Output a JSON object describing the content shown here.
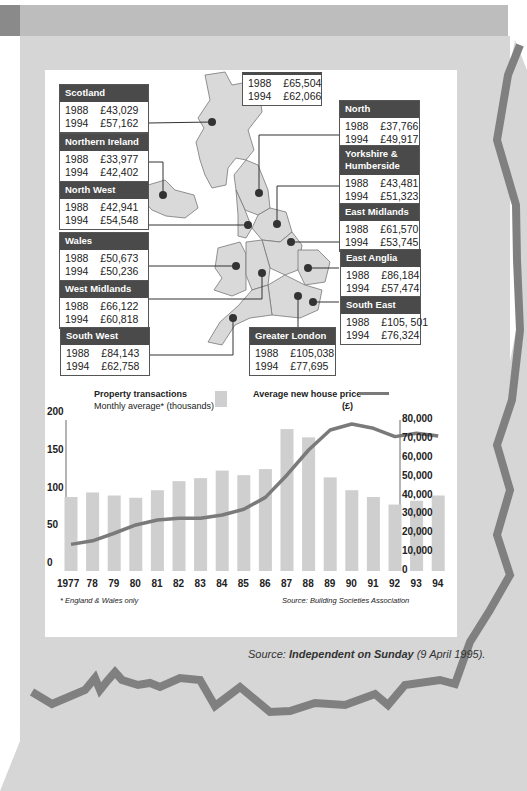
{
  "map": {
    "uk_box": {
      "rows": [
        {
          "year": "1988",
          "price": "£65,504"
        },
        {
          "year": "1994",
          "price": "£62,066"
        }
      ]
    },
    "regions": [
      {
        "name": "Scotland",
        "rows": [
          {
            "year": "1988",
            "price": "£43,029"
          },
          {
            "year": "1994",
            "price": "£57,162"
          }
        ]
      },
      {
        "name": "Northern Ireland",
        "rows": [
          {
            "year": "1988",
            "price": "£33,977"
          },
          {
            "year": "1994",
            "price": "£42,402"
          }
        ]
      },
      {
        "name": "North West",
        "rows": [
          {
            "year": "1988",
            "price": "£42,941"
          },
          {
            "year": "1994",
            "price": "£54,548"
          }
        ]
      },
      {
        "name": "Wales",
        "rows": [
          {
            "year": "1988",
            "price": "£50,673"
          },
          {
            "year": "1994",
            "price": "£50,236"
          }
        ]
      },
      {
        "name": "West Midlands",
        "rows": [
          {
            "year": "1988",
            "price": "£66,122"
          },
          {
            "year": "1994",
            "price": "£60,818"
          }
        ]
      },
      {
        "name": "South West",
        "rows": [
          {
            "year": "1988",
            "price": "£84,143"
          },
          {
            "year": "1994",
            "price": "£62,758"
          }
        ]
      },
      {
        "name": "North",
        "rows": [
          {
            "year": "1988",
            "price": "£37,766"
          },
          {
            "year": "1994",
            "price": "£49,917"
          }
        ]
      },
      {
        "name": "Yorkshire & Humberside",
        "rows": [
          {
            "year": "1988",
            "price": "£43,481"
          },
          {
            "year": "1994",
            "price": "£51,323"
          }
        ]
      },
      {
        "name": "East Midlands",
        "rows": [
          {
            "year": "1988",
            "price": "£61,570"
          },
          {
            "year": "1994",
            "price": "£53,745"
          }
        ]
      },
      {
        "name": "East Anglia",
        "rows": [
          {
            "year": "1988",
            "price": "£86,184"
          },
          {
            "year": "1994",
            "price": "£57,474"
          }
        ]
      },
      {
        "name": "South East",
        "rows": [
          {
            "year": "1988",
            "price": "£105, 501"
          },
          {
            "year": "1994",
            "price": "£76,324"
          }
        ]
      },
      {
        "name": "Greater London",
        "rows": [
          {
            "year": "1988",
            "price": "£105,038"
          },
          {
            "year": "1994",
            "price": "£77,695"
          }
        ]
      }
    ]
  },
  "legend": {
    "bars_title": "Property transactions",
    "bars_sub": "Monthly average* (thousands)",
    "line_title": "Average new house price",
    "line_unit": "(£)"
  },
  "footnote": "* England & Wales only",
  "chart_source": "Source: Building Societies Association",
  "page_source": {
    "prefix": "Source: ",
    "publication": "Independent on Sunday",
    "date": " (9 April 1995)."
  },
  "colors": {
    "bar": "#cfcfcf",
    "line": "#7a7a7a",
    "header": "#4a4a4a",
    "panel": "#d6d6d6",
    "zigzag": "#808080"
  },
  "chart_data": {
    "type": "bar+line",
    "title": "",
    "categories": [
      "1977",
      "78",
      "79",
      "80",
      "81",
      "82",
      "83",
      "84",
      "85",
      "86",
      "87",
      "88",
      "89",
      "90",
      "91",
      "92",
      "93",
      "94"
    ],
    "series": [
      {
        "name": "Property transactions — Monthly average* (thousands)",
        "type": "bar",
        "axis": "left",
        "values": [
          98,
          104,
          100,
          97,
          107,
          119,
          123,
          133,
          127,
          135,
          188,
          177,
          124,
          107,
          98,
          88,
          93,
          100
        ]
      },
      {
        "name": "Average new house price (£)",
        "type": "line",
        "axis": "right",
        "values": [
          14100,
          16000,
          20000,
          24400,
          27000,
          27900,
          28000,
          29700,
          32700,
          39000,
          50900,
          64100,
          74700,
          77900,
          75600,
          71200,
          73000,
          71500
        ]
      }
    ],
    "left_axis": {
      "ticks": [
        "0",
        "50",
        "100",
        "150",
        "200"
      ],
      "ylim": [
        0,
        200
      ]
    },
    "right_axis": {
      "ticks": [
        "0",
        "10,000",
        "20,000",
        "30,000",
        "40,000",
        "50,000",
        "60,000",
        "70,000",
        "80,000"
      ],
      "ylim": [
        0,
        80000
      ]
    },
    "xlabel": "",
    "grid": false,
    "legend_position": "top"
  }
}
